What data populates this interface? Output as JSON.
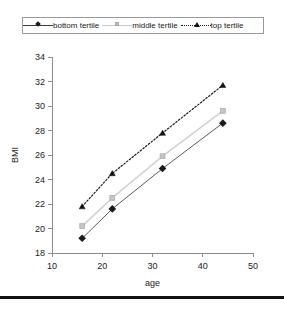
{
  "legend": {
    "position": "top",
    "entries": [
      {
        "label": "bottom tertile",
        "marker": "diamond-marker",
        "line": "solid",
        "color": "#5a5a5a"
      },
      {
        "label": "middle tertile",
        "marker": "square-marker",
        "line": "solid",
        "color": "#d2d2d2"
      },
      {
        "label": "top tertile",
        "marker": "triangle-marker",
        "line": "dotted",
        "color": "#1b1b1b"
      }
    ]
  },
  "chart_data": {
    "type": "line",
    "title": "",
    "xlabel": "age",
    "ylabel": "BMI",
    "xlim": [
      10,
      50
    ],
    "ylim": [
      18,
      34
    ],
    "xticks": [
      10,
      20,
      30,
      40,
      50
    ],
    "yticks": [
      18,
      20,
      22,
      24,
      26,
      28,
      30,
      32,
      34
    ],
    "grid": false,
    "legend_position": "top",
    "x": [
      16,
      22,
      32,
      44
    ],
    "series": [
      {
        "name": "bottom tertile",
        "values": [
          19.2,
          21.6,
          24.9,
          28.6
        ],
        "marker": "diamond",
        "line": "solid",
        "color": "#5a5a5a"
      },
      {
        "name": "middle tertile",
        "values": [
          20.2,
          22.5,
          25.9,
          29.6
        ],
        "marker": "square",
        "line": "solid",
        "color": "#d2d2d2"
      },
      {
        "name": "top tertile",
        "values": [
          21.8,
          24.5,
          27.8,
          31.7
        ],
        "marker": "triangle",
        "line": "dotted",
        "color": "#1b1b1b"
      }
    ]
  }
}
